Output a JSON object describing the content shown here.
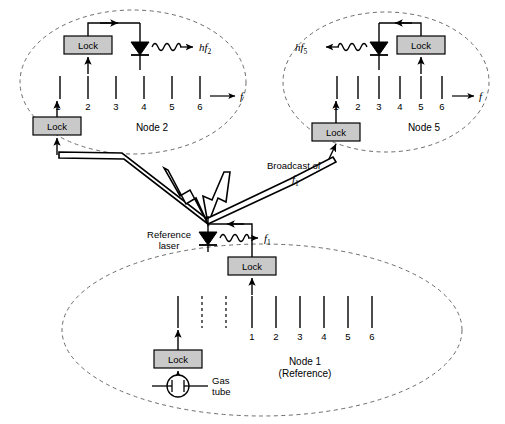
{
  "diagram": {
    "colors": {
      "stroke": "#000000",
      "lock_fill": "#c9c9c9",
      "background": "#ffffff",
      "dashed_ellipse": "#6b6b6b"
    },
    "lock_label": "Lock",
    "freq_axis_label": "f",
    "nodes": [
      {
        "id": "node2",
        "label": "Node 2",
        "emission_label": "hf",
        "emission_sub": "2",
        "ticks": [
          "1",
          "2",
          "3",
          "4",
          "5",
          "6"
        ],
        "locked_tick": "2",
        "laser_tick": "4",
        "input_lock_tick": "1"
      },
      {
        "id": "node5",
        "label": "Node 5",
        "emission_label": "hf",
        "emission_sub": "5",
        "ticks": [
          "1",
          "2",
          "3",
          "4",
          "5",
          "6"
        ],
        "locked_tick": "5",
        "laser_tick": "3",
        "input_lock_tick": "1"
      },
      {
        "id": "node1",
        "label_line1": "Node 1",
        "label_line2": "(Reference)",
        "reference_laser_line1": "Reference",
        "reference_laser_line2": "laser",
        "emission_label": "f",
        "emission_sub": "1",
        "ticks": [
          "1",
          "2",
          "3",
          "4",
          "5",
          "6"
        ],
        "locked_tick": "1",
        "gas_tube_line1": "Gas",
        "gas_tube_line2": "tube"
      }
    ],
    "broadcast": {
      "label_line1": "Broadcast of",
      "label_line2": "f",
      "label_line2_sub": "1"
    },
    "icons": {
      "laser_diode": "laser-diode-icon",
      "gas_tube": "gas-tube-icon",
      "wavy_emission": "wavy-emission-icon",
      "lightning": "lightning-bolt-icon"
    }
  }
}
